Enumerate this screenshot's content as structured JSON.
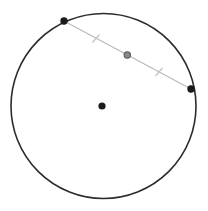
{
  "figure": {
    "type": "geometry-diagram",
    "canvas": {
      "width": 208,
      "height": 211,
      "background": "#ffffff"
    },
    "colors": {
      "circle_stroke": "#2b2b2b",
      "chord_stroke": "#b9b9b9",
      "point_fill": "#1a1a1a",
      "midpoint_fill": "#8a8a8a",
      "midpoint_stroke": "#5a5a5a",
      "tick_stroke": "#c4c4c4",
      "background": "#ffffff"
    },
    "circle": {
      "label": "circle",
      "cx": 103.5,
      "cy": 106,
      "r": 92.5,
      "stroke_width": 1.6,
      "fill": "none"
    },
    "center_point": {
      "label": "center",
      "cx": 102,
      "cy": 106,
      "r": 3.6
    },
    "chord": {
      "label": "chord",
      "x1": 64,
      "y1": 21,
      "x2": 191,
      "y2": 89,
      "stroke_width": 1.1
    },
    "endpoints": [
      {
        "label": "chord-endpoint-a",
        "cx": 64,
        "cy": 21,
        "r": 3.7
      },
      {
        "label": "chord-endpoint-b",
        "cx": 191,
        "cy": 89,
        "r": 3.7
      }
    ],
    "midpoint": {
      "label": "chord-midpoint",
      "cx": 127.3,
      "cy": 55.1,
      "r": 3.2,
      "stroke_width": 1.1
    },
    "ticks": [
      {
        "label": "congruence-tick-1",
        "x1": 92.5,
        "y1": 42.5,
        "x2": 99.5,
        "y2": 34.5,
        "stroke_width": 1.3
      },
      {
        "label": "congruence-tick-2",
        "x1": 155.5,
        "y1": 76.0,
        "x2": 162.5,
        "y2": 68.0,
        "stroke_width": 1.3
      }
    ]
  }
}
